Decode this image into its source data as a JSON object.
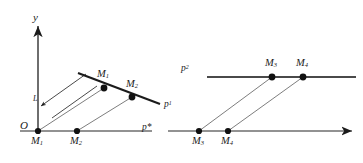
{
  "figure": {
    "kind": "geometric-diagram",
    "background_color": "#ffffff",
    "ink_color": "#1b1b1b",
    "thin_color": "#6e6e6e",
    "axes": {
      "y_axis_label": "y",
      "origin_label": "O",
      "horizontal_axis_label": "p*"
    },
    "labels": {
      "vector_arrow": "L",
      "line_p1": "p",
      "line_p1_sup": "1",
      "line_p2": "p",
      "line_p2_sup": "2",
      "m1": "M",
      "m1_sub": "1",
      "m2": "M",
      "m2_sub": "2",
      "m3": "M",
      "m3_sub": "3",
      "m4": "M",
      "m4_sub": "4"
    },
    "left_panel": {
      "axis_points": [
        {
          "name": "M1",
          "label_base": "M",
          "label_sub": "1",
          "x": 38,
          "y": 131
        },
        {
          "name": "M2",
          "label_base": "M",
          "label_sub": "2",
          "x": 77,
          "y": 131
        }
      ],
      "line_points": [
        {
          "name": "M1",
          "label_base": "M",
          "label_sub": "1",
          "x": 104,
          "y": 88
        },
        {
          "name": "M2",
          "label_base": "M",
          "label_sub": "2",
          "x": 132,
          "y": 97
        }
      ],
      "line_p1_start": {
        "x": 78,
        "y": 73
      },
      "line_p1_end": {
        "x": 160,
        "y": 104
      }
    },
    "right_panel": {
      "axis_points": [
        {
          "name": "M3",
          "label_base": "M",
          "label_sub": "3",
          "x": 199,
          "y": 131
        },
        {
          "name": "M4",
          "label_base": "M",
          "label_sub": "4",
          "x": 228,
          "y": 131
        }
      ],
      "line_points": [
        {
          "name": "M3",
          "label_base": "M",
          "label_sub": "3",
          "x": 272,
          "y": 77
        },
        {
          "name": "M4",
          "label_base": "M",
          "label_sub": "4",
          "x": 303,
          "y": 77
        }
      ],
      "line_p2_start": {
        "x": 207,
        "y": 77
      },
      "line_p2_end": {
        "x": 356,
        "y": 77
      }
    }
  }
}
